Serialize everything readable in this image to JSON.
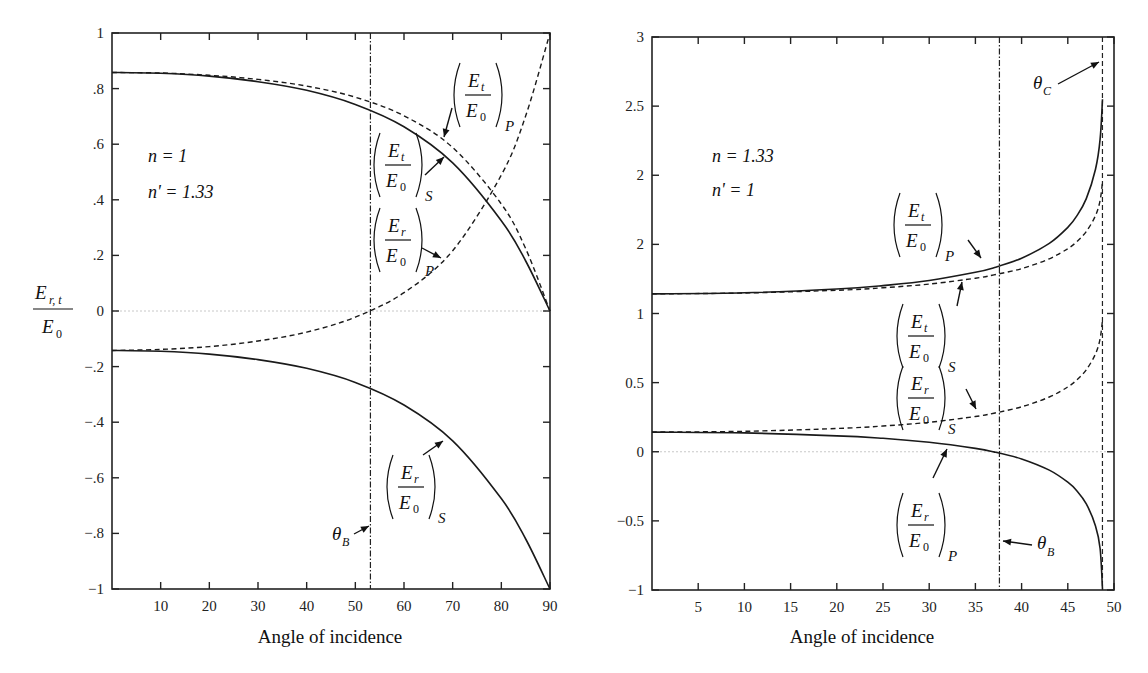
{
  "chart_data": [
    {
      "type": "line",
      "title": "",
      "xlabel": "Angle of incidence",
      "ylabel": "E_{r,t} / E_0",
      "ylabel_parts": {
        "num": "E",
        "num_sub": "r, t",
        "den": "E",
        "den_sub": "0"
      },
      "xlim": [
        0,
        90
      ],
      "ylim": [
        -1,
        1
      ],
      "xticks": [
        10,
        20,
        30,
        40,
        50,
        60,
        70,
        80,
        90
      ],
      "xtick_labels": [
        "10",
        "20",
        "30",
        "40",
        "50",
        "60",
        "70",
        "80",
        "90"
      ],
      "yticks": [
        1,
        0.8,
        0.6,
        0.4,
        0.2,
        0,
        -0.2,
        -0.4,
        -0.6,
        -0.8,
        -1
      ],
      "ytick_labels": [
        "1",
        ".8",
        ".6",
        ".4",
        ".2",
        "0",
        "−.2",
        "−.4",
        "−.6",
        "−.8",
        "−1"
      ],
      "grid": false,
      "zero_line": true,
      "params": [
        "n = 1",
        "n' = 1.33"
      ],
      "x": [
        0,
        10,
        20,
        30,
        40,
        50,
        60,
        70,
        80,
        85,
        90
      ],
      "series": [
        {
          "name": "(E_t/E_0)_S",
          "style": "solid",
          "values": [
            0.858,
            0.855,
            0.845,
            0.825,
            0.794,
            0.743,
            0.663,
            0.533,
            0.325,
            0.18,
            0.0
          ]
        },
        {
          "name": "(E_t/E_0)_P",
          "style": "dashed",
          "values": [
            0.858,
            0.856,
            0.848,
            0.833,
            0.809,
            0.769,
            0.702,
            0.588,
            0.385,
            0.224,
            0.0
          ]
        },
        {
          "name": "(E_r/E_0)_P",
          "style": "dashed",
          "values": [
            -0.142,
            -0.138,
            -0.128,
            -0.108,
            -0.076,
            -0.022,
            0.066,
            0.217,
            0.489,
            0.702,
            1.0
          ]
        },
        {
          "name": "(E_r/E_0)_S",
          "style": "solid",
          "values": [
            -0.142,
            -0.145,
            -0.155,
            -0.175,
            -0.206,
            -0.257,
            -0.338,
            -0.467,
            -0.675,
            -0.82,
            -1.0
          ]
        }
      ],
      "vlines": [
        {
          "name": "θ_B",
          "x": 53.1,
          "style": "dash-dot"
        }
      ],
      "annotations": [
        {
          "text": "(E_t/E_0)_P",
          "target": "(E_t/E_0)_P"
        },
        {
          "text": "(E_t/E_0)_S",
          "target": "(E_t/E_0)_S"
        },
        {
          "text": "(E_r/E_0)_P",
          "target": "(E_r/E_0)_P"
        },
        {
          "text": "(E_r/E_0)_S",
          "target": "(E_r/E_0)_S"
        },
        {
          "text": "θ_B",
          "target": "Brewster angle line"
        }
      ]
    },
    {
      "type": "line",
      "title": "",
      "xlabel": "Angle of incidence",
      "ylabel": "",
      "xlim": [
        0,
        50
      ],
      "ylim": [
        -1,
        3
      ],
      "xticks": [
        5,
        10,
        15,
        20,
        25,
        30,
        35,
        40,
        45,
        50
      ],
      "xtick_labels": [
        "5",
        "10",
        "15",
        "20",
        "25",
        "30",
        "35",
        "40",
        "45",
        "50"
      ],
      "yticks": [
        3,
        2.5,
        2,
        1.5,
        1,
        0.5,
        0,
        -0.5,
        -1
      ],
      "ytick_labels": [
        "3",
        "2.5",
        "2",
        "2",
        "1",
        "0.5",
        "0",
        "−0.5",
        "−1"
      ],
      "grid": false,
      "zero_line": true,
      "params": [
        "n = 1.33",
        "n' = 1"
      ],
      "x": [
        0,
        10,
        20,
        25,
        30,
        35,
        37,
        40,
        43,
        45,
        46,
        47,
        48,
        48.5,
        48.75
      ],
      "series": [
        {
          "name": "(E_t/E_0)_P",
          "style": "solid",
          "values": [
            1.142,
            1.15,
            1.177,
            1.202,
            1.239,
            1.298,
            1.331,
            1.4,
            1.507,
            1.623,
            1.708,
            1.831,
            2.043,
            2.261,
            2.55
          ]
        },
        {
          "name": "(E_t/E_0)_S",
          "style": "dashed",
          "values": [
            1.142,
            1.148,
            1.168,
            1.186,
            1.213,
            1.255,
            1.279,
            1.325,
            1.396,
            1.469,
            1.521,
            1.593,
            1.708,
            1.818,
            1.952
          ]
        },
        {
          "name": "(E_r/E_0)_S",
          "style": "dashed",
          "values": [
            0.142,
            0.148,
            0.168,
            0.186,
            0.213,
            0.255,
            0.279,
            0.325,
            0.396,
            0.469,
            0.521,
            0.593,
            0.708,
            0.818,
            0.952
          ]
        },
        {
          "name": "(E_r/E_0)_P",
          "style": "solid",
          "values": [
            0.142,
            0.136,
            0.115,
            0.097,
            0.068,
            0.024,
            -0.001,
            -0.052,
            -0.133,
            -0.22,
            -0.284,
            -0.377,
            -0.536,
            -0.7,
            -0.995
          ]
        }
      ],
      "vlines": [
        {
          "name": "θ_B",
          "x": 37.6,
          "style": "dash-dot"
        },
        {
          "name": "θ_C",
          "x": 48.75,
          "style": "dashed"
        }
      ],
      "annotations": [
        {
          "text": "θ_C",
          "target": "critical angle line"
        },
        {
          "text": "(E_t/E_0)_P",
          "target": "(E_t/E_0)_P"
        },
        {
          "text": "(E_t/E_0)_S",
          "target": "(E_t/E_0)_S"
        },
        {
          "text": "(E_r/E_0)_S",
          "target": "(E_r/E_0)_S"
        },
        {
          "text": "(E_r/E_0)_P",
          "target": "(E_r/E_0)_P"
        },
        {
          "text": "θ_B",
          "target": "Brewster angle line"
        }
      ]
    }
  ],
  "labels": {
    "E": "E",
    "zero": "0",
    "theta": "θ",
    "B": "B",
    "C": "C",
    "r": "r",
    "t": "t",
    "S": "S",
    "P": "P"
  }
}
